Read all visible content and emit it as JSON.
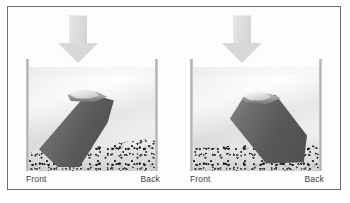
{
  "figure": {
    "frame_color": "#6e6e6e",
    "background_color": "#ffffff",
    "panels": [
      {
        "id": "left",
        "arrow_icon": "down-arrow-icon",
        "labels": {
          "front": "Front",
          "back": "Back"
        }
      },
      {
        "id": "right",
        "arrow_icon": "down-arrow-icon",
        "labels": {
          "front": "Front",
          "back": "Back"
        }
      }
    ]
  },
  "colors": {
    "arrow": "#d8d8d8",
    "wedge_dark": "#585858",
    "gravel_base": "#dedede",
    "water_light": "#f0f0f0",
    "wall": "#b4b4b4",
    "label_text": "#3c3c3c"
  }
}
